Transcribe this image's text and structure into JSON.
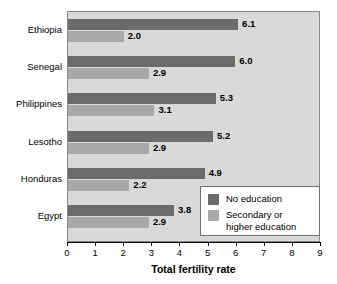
{
  "chart_data": {
    "type": "bar",
    "orientation": "horizontal",
    "title": "",
    "xlabel": "Total fertility rate",
    "ylabel": "",
    "xlim": [
      0,
      9
    ],
    "xticks": [
      "0",
      "1",
      "2",
      "3",
      "4",
      "5",
      "6",
      "7",
      "8",
      "9"
    ],
    "grid": false,
    "legend_position": "bottom-right",
    "categories": [
      "Ethiopia",
      "Senegal",
      "Philippines",
      "Lesotho",
      "Honduras",
      "Egypt"
    ],
    "series": [
      {
        "name": "No education",
        "color": "#6b6b6b",
        "values": [
          6.1,
          6.0,
          5.3,
          5.2,
          4.9,
          3.8
        ],
        "labels": [
          "6.1",
          "6.0",
          "5.3",
          "5.2",
          "4.9",
          "3.8"
        ]
      },
      {
        "name": "Secondary or\nhigher education",
        "color": "#a8a8a8",
        "values": [
          2.0,
          2.9,
          3.1,
          2.9,
          2.2,
          2.9
        ],
        "labels": [
          "2.0",
          "2.9",
          "3.1",
          "2.9",
          "2.2",
          "2.9"
        ]
      }
    ]
  },
  "colors": {
    "plot_background": "#d9d9d9",
    "no_education": "#6b6b6b",
    "secondary_education": "#a8a8a8",
    "axis": "#000000",
    "legend_background": "#ffffff"
  }
}
